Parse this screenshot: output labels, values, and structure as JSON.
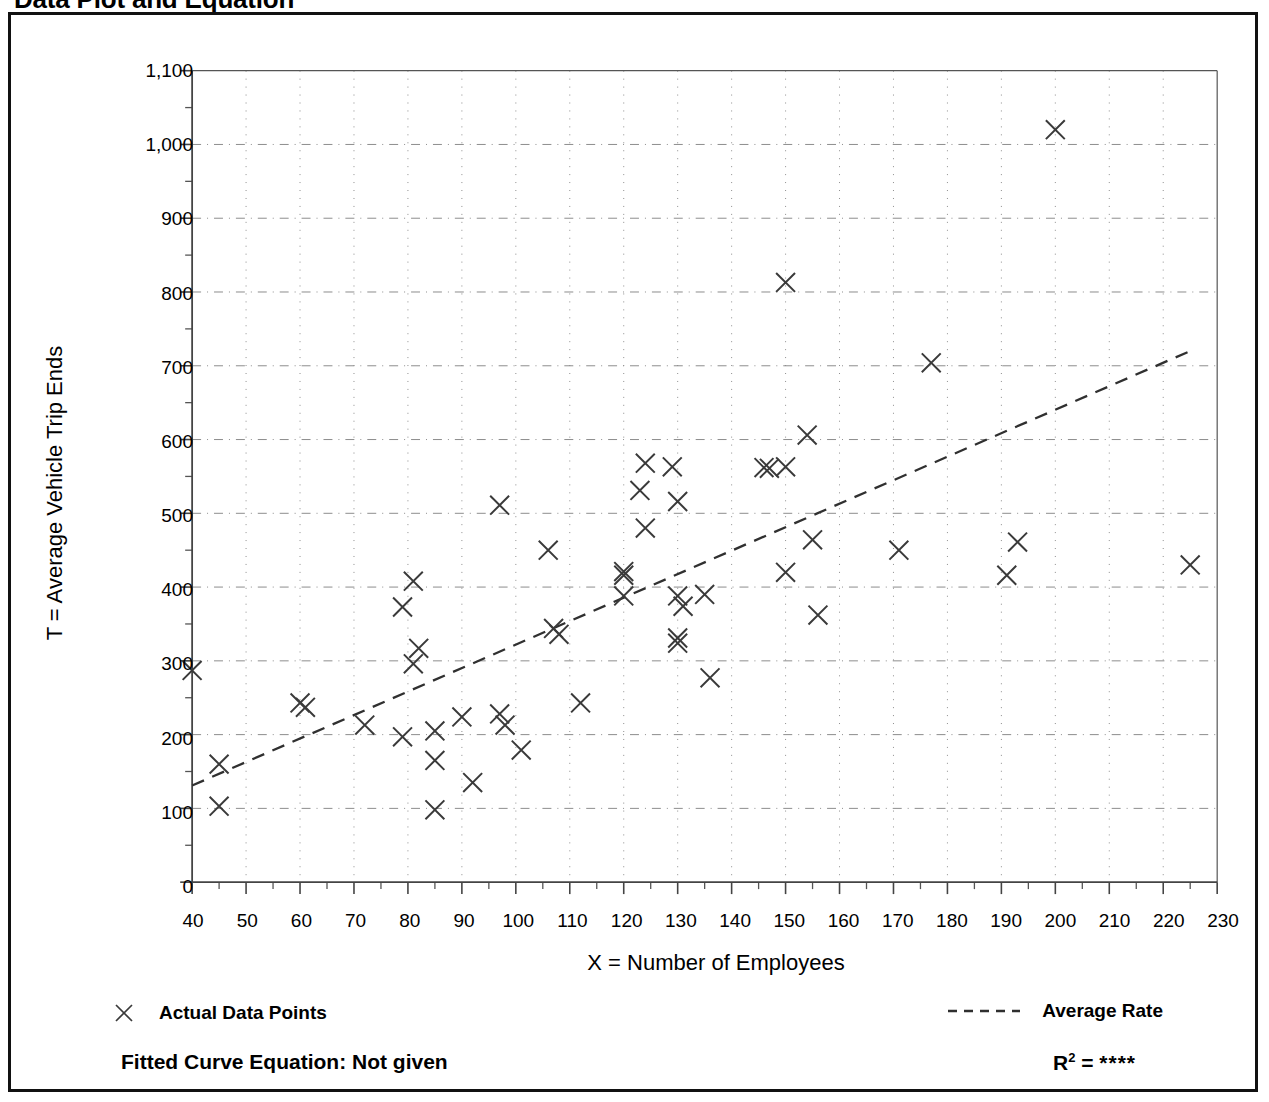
{
  "title": "Data Plot and Equation",
  "chart_data": {
    "type": "scatter",
    "title": "Data Plot and Equation",
    "xlabel": "X = Number of Employees",
    "ylabel": "T = Average Vehicle Trip Ends",
    "xlim": [
      40,
      230
    ],
    "ylim": [
      0,
      1100
    ],
    "xticks": [
      40,
      50,
      60,
      70,
      80,
      90,
      100,
      110,
      120,
      130,
      140,
      150,
      160,
      170,
      180,
      190,
      200,
      210,
      220,
      230
    ],
    "yticks": [
      0,
      100,
      200,
      300,
      400,
      500,
      600,
      700,
      800,
      900,
      1000,
      1100
    ],
    "ytick_labels": [
      "0",
      "100",
      "200",
      "300",
      "400",
      "500",
      "600",
      "700",
      "800",
      "900",
      "1,000",
      "1,100"
    ],
    "xtick_labels": [
      "40",
      "50",
      "60",
      "70",
      "80",
      "90",
      "100",
      "110",
      "120",
      "130",
      "140",
      "150",
      "160",
      "170",
      "180",
      "190",
      "200",
      "210",
      "220",
      "230"
    ],
    "grid": true,
    "minor_ticks": true,
    "marker": "x",
    "marker_color": "#3a3a3a",
    "legend_position": "below-axes",
    "series": [
      {
        "name": "Actual Data Points",
        "marker": "x",
        "points": [
          [
            40,
            287
          ],
          [
            45,
            160
          ],
          [
            45,
            103
          ],
          [
            60,
            243
          ],
          [
            61,
            237
          ],
          [
            72,
            213
          ],
          [
            79,
            373
          ],
          [
            79,
            197
          ],
          [
            81,
            408
          ],
          [
            82,
            317
          ],
          [
            81,
            296
          ],
          [
            85,
            205
          ],
          [
            85,
            165
          ],
          [
            85,
            98
          ],
          [
            90,
            224
          ],
          [
            92,
            135
          ],
          [
            97,
            511
          ],
          [
            97,
            228
          ],
          [
            98,
            213
          ],
          [
            101,
            179
          ],
          [
            106,
            450
          ],
          [
            107,
            344
          ],
          [
            108,
            336
          ],
          [
            112,
            243
          ],
          [
            120,
            421
          ],
          [
            120,
            416
          ],
          [
            120,
            388
          ],
          [
            123,
            531
          ],
          [
            124,
            568
          ],
          [
            124,
            480
          ],
          [
            129,
            563
          ],
          [
            130,
            516
          ],
          [
            130,
            388
          ],
          [
            131,
            374
          ],
          [
            130,
            331
          ],
          [
            130,
            324
          ],
          [
            135,
            390
          ],
          [
            136,
            277
          ],
          [
            146,
            562
          ],
          [
            147,
            561
          ],
          [
            150,
            813
          ],
          [
            150,
            563
          ],
          [
            150,
            420
          ],
          [
            154,
            606
          ],
          [
            155,
            464
          ],
          [
            156,
            362
          ],
          [
            171,
            450
          ],
          [
            177,
            704
          ],
          [
            191,
            416
          ],
          [
            193,
            461
          ],
          [
            200,
            1020
          ],
          [
            225,
            430
          ]
        ]
      }
    ],
    "trendline": {
      "name": "Average Rate",
      "style": "dashed",
      "x_start": 40,
      "y_start": 131,
      "x_end": 225,
      "y_end": 720
    }
  },
  "legend": {
    "actual_points_label": "Actual Data Points",
    "actual_points_icon": "x-marker-icon",
    "average_rate_label": "Average Rate",
    "average_rate_icon": "dashed-line-icon"
  },
  "footer": {
    "equation_label": "Fitted Curve Equation:  Not given",
    "r2_label": "R",
    "r2_exponent": "2",
    "r2_equals": " = ",
    "r2_value": "****"
  }
}
